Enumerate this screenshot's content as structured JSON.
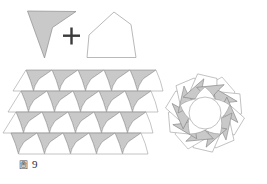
{
  "figure": {
    "caption_glyph": "圖",
    "caption_number": "9",
    "caption_full": "圖 9",
    "plus_symbol": "+",
    "background_color": "#ffffff",
    "fill_gray": "#c9c9c9",
    "fill_white": "#ffffff",
    "stroke_color": "#808080",
    "stroke_dark": "#5a5a5a"
  },
  "legend": {
    "dart_label": "gray-dart-prototile",
    "quad_label": "white-quadrilateral-prototile",
    "operator_label": "plus"
  },
  "panels": [
    {
      "name": "prototiles",
      "label": "prototile pair"
    },
    {
      "name": "strip-tiling",
      "label": "linear strip tessellation"
    },
    {
      "name": "rosette-tiling",
      "label": "radial rosette tessellation"
    }
  ],
  "shapes": {
    "dart": {
      "points": "27,10 75,11 52,28 44,57",
      "fill": "#c9c9c9",
      "stroke": "#8a8a8a"
    },
    "quad": {
      "points": "88,36 113,12 129,24 133,57 86,57",
      "fill": "#ffffff",
      "stroke": "#999999"
    }
  },
  "strip": {
    "origin_x": 18,
    "origin_y": 70,
    "cell_w": 26,
    "cell_h": 21,
    "cols": 5,
    "rows": 4,
    "skew": 9
  },
  "rosette": {
    "center_x": 205,
    "center_y": 113,
    "points_count": 10,
    "outer_r": 52,
    "inner_r": 26
  }
}
